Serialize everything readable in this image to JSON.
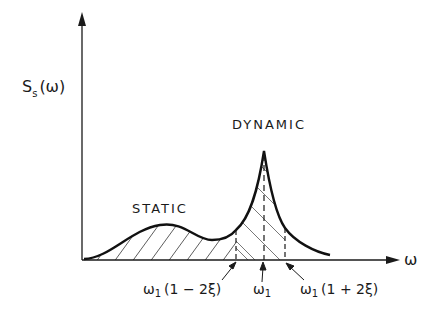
{
  "diagram": {
    "y_axis_label": {
      "main": "S",
      "sub": "s",
      "arg": "(ω)"
    },
    "x_axis_label": "ω",
    "region_labels": {
      "static": "STATIC",
      "dynamic": "DYNAMIC"
    },
    "markers": [
      {
        "id": "lower",
        "base": "ω",
        "sub": "1",
        "expr": "(1 − 2ξ)"
      },
      {
        "id": "center",
        "base": "ω",
        "sub": "1",
        "expr": ""
      },
      {
        "id": "upper",
        "base": "ω",
        "sub": "1",
        "expr": "(1 + 2ξ)"
      }
    ],
    "colors": {
      "ink": "#1a1a1a",
      "background": "#ffffff"
    }
  }
}
